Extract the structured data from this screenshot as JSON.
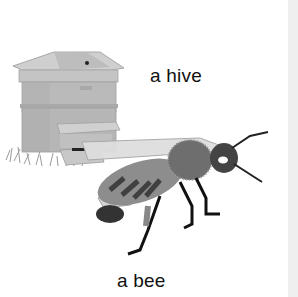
{
  "page": {
    "labels": {
      "hive": "a hive",
      "bee": "a bee"
    },
    "illustrations": [
      {
        "name": "beehive",
        "kind": "illustration"
      },
      {
        "name": "honey-bee",
        "kind": "illustration"
      }
    ],
    "colors": {
      "background": "#ffffff",
      "edge_strip": "#efefef",
      "text": "#111111"
    }
  }
}
